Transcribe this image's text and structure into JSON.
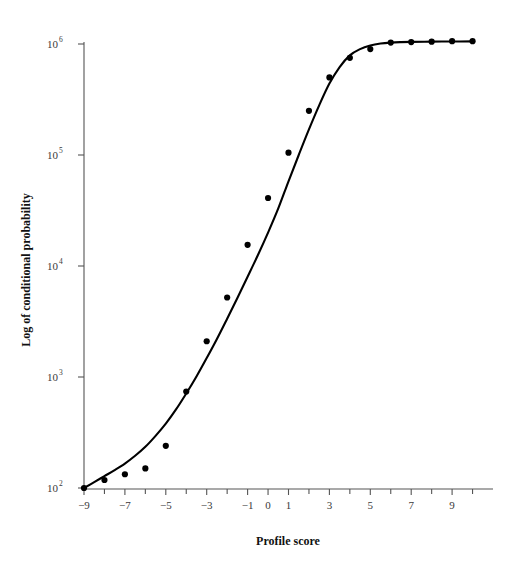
{
  "chart_data": {
    "type": "scatter",
    "title": "",
    "xlabel": "Profile score",
    "ylabel": "Log of conditional probability",
    "yscale": "log",
    "xscale": "linear",
    "xlim": [
      -9.6,
      10.3
    ],
    "ylim": [
      100,
      1200000
    ],
    "grid": false,
    "legend": null,
    "x_major_ticks": [
      -9,
      -7,
      -5,
      -3,
      -1,
      0,
      1,
      3,
      5,
      7,
      9
    ],
    "x_major_tick_labels": [
      "−9",
      "−7",
      "−5",
      "−3",
      "−1",
      "0",
      "1",
      "3",
      "5",
      "7",
      "9"
    ],
    "x_minor_ticks": [
      -8,
      -6,
      -4,
      -2,
      2,
      4,
      6,
      8,
      10
    ],
    "y_ticks": [
      100,
      1000,
      10000,
      100000,
      1000000
    ],
    "y_tick_labels": [
      "10",
      "10",
      "10",
      "10",
      "10"
    ],
    "y_tick_exponents": [
      "2",
      "3",
      "4",
      "5",
      "6"
    ],
    "series": [
      {
        "name": "observed",
        "marker": "filled-circle",
        "marker_color": "#000000",
        "x": [
          -9,
          -8,
          -7,
          -6,
          -5,
          -4,
          -3,
          -2,
          -1,
          0,
          1,
          2,
          3,
          4,
          5,
          6,
          7,
          8,
          9,
          10
        ],
        "y": [
          100,
          118,
          133,
          150,
          240,
          740,
          2100,
          5200,
          15500,
          41000,
          105000,
          250000,
          500000,
          750000,
          900000,
          1030000,
          1040000,
          1050000,
          1060000,
          1060000
        ]
      },
      {
        "name": "fitted-sigmoid",
        "line_color": "#000000",
        "line_width": 2.1,
        "x": [
          -9,
          -8.5,
          -8,
          -7.5,
          -7,
          -6.5,
          -6,
          -5.5,
          -5,
          -4.5,
          -4,
          -3.5,
          -3,
          -2.5,
          -2,
          -1.5,
          -1,
          -0.5,
          0,
          0.5,
          1,
          1.5,
          2,
          2.5,
          3,
          3.5,
          4,
          4.5,
          5,
          5.5,
          6,
          6.5,
          7,
          8,
          9,
          10
        ],
        "y": [
          100,
          113,
          128,
          145,
          166,
          195,
          235,
          295,
          380,
          510,
          710,
          1010,
          1480,
          2200,
          3350,
          5150,
          8000,
          12500,
          20000,
          33000,
          58000,
          100000,
          170000,
          280000,
          440000,
          620000,
          790000,
          900000,
          970000,
          1010000,
          1030000,
          1040000,
          1045000,
          1050000,
          1053000,
          1055000
        ]
      }
    ]
  },
  "figure": {
    "background_color": "#ffffff",
    "axis_color": "#555555",
    "data_color": "#000000",
    "text_color": "#222222"
  }
}
